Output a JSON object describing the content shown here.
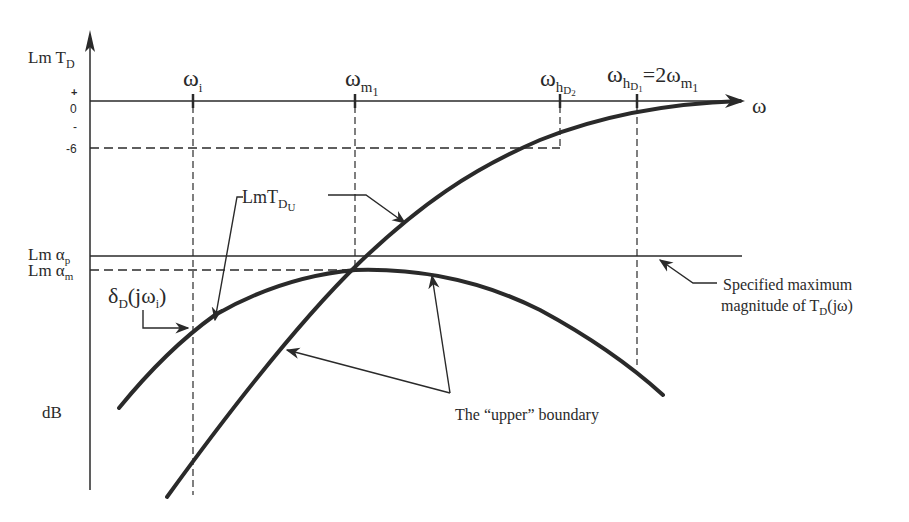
{
  "diagram": {
    "y_axis": {
      "label_main": "Lm T",
      "label_sub": "D",
      "unit": "dB",
      "ticks": {
        "plus": "+",
        "zero": "0",
        "minus": "-",
        "minus6": "-6"
      },
      "lm_alpha_p": {
        "main": "Lm α",
        "sub": "p"
      },
      "lm_alpha_m": {
        "main": "Lm α",
        "sub": "m"
      }
    },
    "x_axis": {
      "label": "ω"
    },
    "frequencies": {
      "omega_i": {
        "main": "ω",
        "sub": "i"
      },
      "omega_m1": {
        "main": "ω",
        "sub": "m",
        "subsub": "1"
      },
      "omega_hD2": {
        "main": "ω",
        "sub": "h",
        "subsub": "D",
        "subsubsub": "2"
      },
      "omega_hD1": {
        "main": "ω",
        "sub": "h",
        "subsub": "D",
        "subsubsub": "1",
        "eq": "=2ω",
        "eq_sub": "m",
        "eq_subsub": "1"
      }
    },
    "annotations": {
      "lmtdu": {
        "main": "LmT",
        "sub": "D",
        "subsub": "U"
      },
      "delta": {
        "main": "δ",
        "sub": "D",
        "rest": "(jω",
        "rest_sub": "i",
        "close": ")"
      },
      "spec_max_line1": "Specified maximum",
      "spec_max_line2_a": "magnitude of T",
      "spec_max_line2_sub": "D",
      "spec_max_line2_b": "(jω)",
      "upper_boundary": "The “upper” boundary"
    },
    "colors": {
      "ink": "#2a2a2a",
      "background": "#ffffff"
    }
  }
}
